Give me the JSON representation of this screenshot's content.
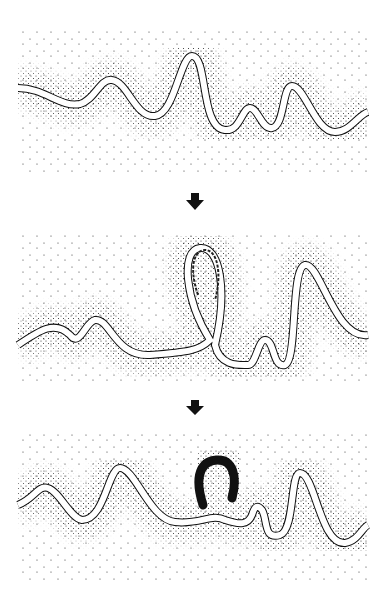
{
  "diagram": {
    "type": "process-sequence",
    "stages": [
      {
        "id": "stage-1",
        "description": "meandering river channel on floodplain"
      },
      {
        "id": "stage-2",
        "description": "meander neck narrows; loop nearly cut off"
      },
      {
        "id": "stage-3",
        "description": "river cuts through neck; abandoned loop becomes crescent oxbow lake"
      }
    ],
    "arrows": [
      {
        "from": "stage-1",
        "to": "stage-2",
        "direction": "down"
      },
      {
        "from": "stage-2",
        "to": "stage-3",
        "direction": "down"
      }
    ],
    "colors": {
      "background": "#ffffff",
      "ink": "#111111",
      "channel": "#ffffff",
      "oxbow": "#111111"
    }
  }
}
